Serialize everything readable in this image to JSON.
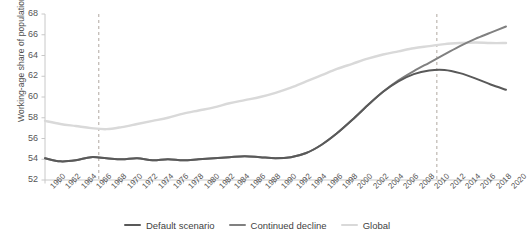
{
  "chart_data": {
    "type": "line",
    "title": "",
    "xlabel": "",
    "ylabel": "Working-age share of population (%)",
    "ylim": [
      52,
      68
    ],
    "yticks": [
      52,
      54,
      56,
      58,
      60,
      62,
      64,
      66,
      68
    ],
    "xlim": [
      1960,
      2020
    ],
    "grid": false,
    "legend_position": "bottom-center",
    "x": [
      1960,
      1962,
      1964,
      1966,
      1968,
      1970,
      1972,
      1974,
      1976,
      1978,
      1980,
      1982,
      1984,
      1986,
      1988,
      1990,
      1992,
      1994,
      1996,
      1998,
      2000,
      2002,
      2004,
      2006,
      2008,
      2010,
      2012,
      2014,
      2016,
      2018,
      2020
    ],
    "categories": [
      "1960",
      "1962",
      "1964",
      "1966",
      "1968",
      "1970",
      "1972",
      "1974",
      "1976",
      "1978",
      "1980",
      "1982",
      "1984",
      "1986",
      "1988",
      "1990",
      "1992",
      "1994",
      "1996",
      "1998",
      "2000",
      "2002",
      "2004",
      "2006",
      "2008",
      "2010",
      "2012",
      "2014",
      "2016",
      "2018",
      "2020"
    ],
    "series": [
      {
        "name": "Default scenario",
        "color": "#595959",
        "values": [
          54.1,
          53.8,
          53.9,
          54.2,
          54.1,
          54.0,
          54.1,
          53.9,
          54.0,
          53.9,
          54.0,
          54.1,
          54.2,
          54.3,
          54.2,
          54.1,
          54.2,
          54.6,
          55.4,
          56.5,
          57.8,
          59.2,
          60.5,
          61.5,
          62.2,
          62.55,
          62.6,
          62.3,
          61.8,
          61.2,
          60.7
        ]
      },
      {
        "name": "Continued decline",
        "color": "#808080",
        "values": [
          54.1,
          53.8,
          53.9,
          54.2,
          54.1,
          54.0,
          54.1,
          53.9,
          54.0,
          53.9,
          54.0,
          54.1,
          54.2,
          54.3,
          54.2,
          54.1,
          54.2,
          54.6,
          55.4,
          56.5,
          57.8,
          59.2,
          60.5,
          61.6,
          62.5,
          63.3,
          64.1,
          64.9,
          65.6,
          66.2,
          66.8
        ]
      },
      {
        "name": "Global",
        "color": "#d9d9d9",
        "values": [
          57.7,
          57.4,
          57.2,
          57.0,
          56.9,
          57.1,
          57.4,
          57.7,
          58.0,
          58.4,
          58.7,
          59.0,
          59.4,
          59.7,
          60.0,
          60.4,
          60.9,
          61.5,
          62.1,
          62.7,
          63.2,
          63.7,
          64.1,
          64.4,
          64.7,
          64.9,
          65.1,
          65.2,
          65.25,
          65.2,
          65.2
        ]
      }
    ],
    "reference_lines": [
      {
        "name": "marker-1967",
        "x": 1967,
        "style": "dashed",
        "color": "#b0a8a0"
      },
      {
        "name": "marker-2011",
        "x": 2011,
        "style": "dashed",
        "color": "#b0a8a0"
      }
    ]
  },
  "legend": {
    "items": [
      {
        "label": "Default scenario",
        "color": "#595959"
      },
      {
        "label": "Continued decline",
        "color": "#808080"
      },
      {
        "label": "Global",
        "color": "#d9d9d9"
      }
    ]
  },
  "axis": {
    "color": "#c8c8c8",
    "tick_color": "#555555"
  }
}
